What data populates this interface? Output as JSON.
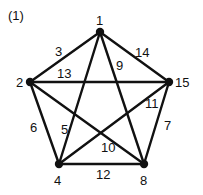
{
  "figure_label": "(1)",
  "colors": {
    "stroke": "#111111",
    "text": "#111111",
    "background": "#ffffff"
  },
  "nodes": [
    {
      "id": "1",
      "label": "1",
      "x": 100,
      "y": 32,
      "lx": 96,
      "ly": 25
    },
    {
      "id": "2",
      "label": "2",
      "x": 30,
      "y": 82,
      "lx": 16,
      "ly": 87
    },
    {
      "id": "15",
      "label": "15",
      "x": 169,
      "y": 82,
      "lx": 175,
      "ly": 87
    },
    {
      "id": "4",
      "label": "4",
      "x": 59,
      "y": 164,
      "lx": 54,
      "ly": 185
    },
    {
      "id": "8",
      "label": "8",
      "x": 144,
      "y": 164,
      "lx": 140,
      "ly": 185
    }
  ],
  "edges": [
    {
      "from": "1",
      "to": "2",
      "label": "3",
      "lx": 55,
      "ly": 56
    },
    {
      "from": "1",
      "to": "15",
      "label": "14",
      "lx": 135,
      "ly": 57
    },
    {
      "from": "2",
      "to": "15",
      "label": "13",
      "lx": 57,
      "ly": 78
    },
    {
      "from": "1",
      "to": "4",
      "label": "5",
      "lx": 61,
      "ly": 134
    },
    {
      "from": "1",
      "to": "8",
      "label": "9",
      "lx": 116,
      "ly": 70
    },
    {
      "from": "2",
      "to": "4",
      "label": "6",
      "lx": 30,
      "ly": 132
    },
    {
      "from": "15",
      "to": "8",
      "label": "7",
      "lx": 164,
      "ly": 130
    },
    {
      "from": "2",
      "to": "8",
      "label": "10",
      "lx": 101,
      "ly": 152
    },
    {
      "from": "15",
      "to": "4",
      "label": "11",
      "lx": 145,
      "ly": 108
    },
    {
      "from": "4",
      "to": "8",
      "label": "12",
      "lx": 96,
      "ly": 179
    }
  ]
}
